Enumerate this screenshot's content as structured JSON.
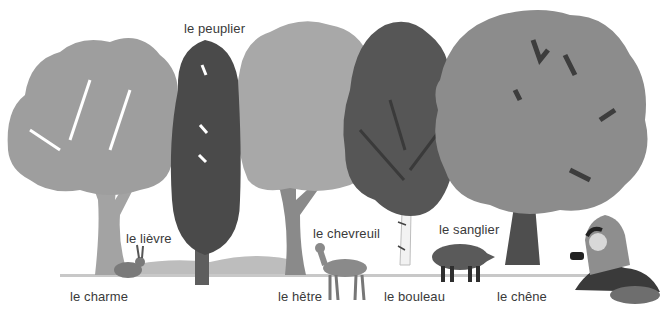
{
  "illustration": {
    "theme": "forest trees and animals",
    "colors": {
      "background": "#ffffff",
      "light_foliage": "#9e9e9e",
      "mid_foliage": "#8c8c8c",
      "dark_foliage": "#4a4a4a",
      "trunk": "#7a7a7a",
      "dark_trunk": "#555555",
      "ground": "#b5b5b5",
      "label_text": "#3a3a3a"
    },
    "labels": {
      "charme": "le charme",
      "peuplier": "le peuplier",
      "lievre": "le lièvre",
      "hetre": "le hêtre",
      "chevreuil": "le chevreuil",
      "bouleau": "le bouleau",
      "sanglier": "le sanglier",
      "chene": "le chêne"
    }
  }
}
